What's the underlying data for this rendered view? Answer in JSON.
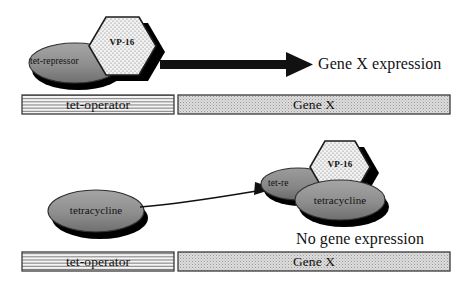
{
  "figure": {
    "colors": {
      "ink": "#111111",
      "shadow": "#000000",
      "blob_fill": "#8c8c8c",
      "blob_fill_light": "#9a9a9a",
      "hex_fill": "#f2f2f2",
      "hex_stipple": "#777777",
      "operator_fill": "#f4f4f4",
      "operator_stripe": "#4a4a4a",
      "gene_fill": "#d8d8d8",
      "gene_stipple": "#8a8a8a",
      "box_border": "#3a3a3a"
    },
    "panels": [
      {
        "id": "panel-active",
        "name": "activation-panel",
        "activator": {
          "hexagon_label": "VP-16",
          "repressor_label": "tet-repressor"
        },
        "arrow": "thick-right-arrow",
        "outcome_label": "Gene X expression",
        "dna": {
          "operator_label": "tet-operator",
          "gene_label": "Gene X"
        }
      },
      {
        "id": "panel-inhibited",
        "name": "inhibition-panel",
        "free_ligand_label": "tetracycline",
        "arrow": "thin-curved-arrow",
        "complex": {
          "hexagon_label": "VP-16",
          "repressor_label": "tet-re",
          "ligand_label": "tetracycline"
        },
        "outcome_label": "No gene expression",
        "dna": {
          "operator_label": "tet-operator",
          "gene_label": "Gene X"
        }
      }
    ]
  }
}
